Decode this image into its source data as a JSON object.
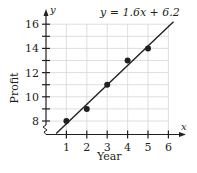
{
  "chart_data": {
    "type": "scatter",
    "title": "",
    "equation": "y = 1.6x + 6.2",
    "xlabel": "Year",
    "ylabel": "Profit",
    "x_axis_symbol": "x",
    "y_axis_symbol": "y",
    "xlim": [
      0,
      6
    ],
    "ylim": [
      7,
      16
    ],
    "x_ticks": [
      1,
      2,
      3,
      4,
      5,
      6
    ],
    "y_tick_labels": [
      8,
      10,
      12,
      14,
      16
    ],
    "y_axis_break": true,
    "grid": true,
    "points": [
      {
        "x": 1,
        "y": 8
      },
      {
        "x": 2,
        "y": 9
      },
      {
        "x": 3,
        "y": 11
      },
      {
        "x": 4,
        "y": 13
      },
      {
        "x": 5,
        "y": 14
      }
    ],
    "regression_line": {
      "slope": 1.6,
      "intercept": 6.2
    }
  },
  "labels": {
    "equation": "y = 1.6x + 6.2",
    "xlabel": "Year",
    "ylabel": "Profit",
    "x_symbol": "x",
    "y_symbol": "y",
    "xticks": [
      "1",
      "2",
      "3",
      "4",
      "5",
      "6"
    ],
    "yticks": [
      "8",
      "10",
      "12",
      "14",
      "16"
    ]
  }
}
